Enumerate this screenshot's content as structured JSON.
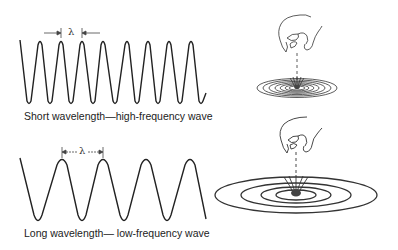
{
  "diagram": {
    "short_wave": {
      "caption": "Short wavelength—high-frequency wave",
      "lambda_label": "λ",
      "peaks_x": [
        40,
        61,
        82,
        103,
        127,
        148,
        169,
        191
      ],
      "troughs_x": [
        29,
        50,
        71,
        93,
        115,
        137,
        158,
        180,
        201
      ],
      "peak_y": 41,
      "trough_y": 104
    },
    "long_wave": {
      "caption": "Long wavelength— low-frequency wave",
      "lambda_label": "λ",
      "peaks_x": [
        62,
        103,
        146,
        190
      ],
      "troughs_x": [
        38,
        82,
        124,
        167
      ],
      "peak_y": 159,
      "trough_y": 222
    },
    "illustrations": [
      {
        "name": "small-stone-drop",
        "ripple_count": 8
      },
      {
        "name": "large-stone-drop",
        "ripple_count": 4
      }
    ],
    "colors": {
      "line": "#222222",
      "background": "#ffffff",
      "stone": "#444444"
    }
  }
}
